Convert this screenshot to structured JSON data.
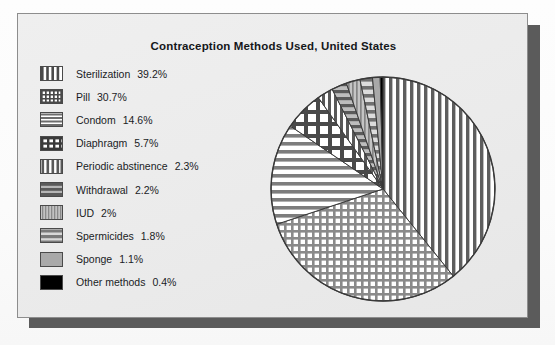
{
  "chart_data": {
    "type": "pie",
    "title": "Contraception Methods Used, United States",
    "xlabel": "",
    "ylabel": "",
    "legend_position": "left",
    "grid": false,
    "units": "percent",
    "start_angle_deg": 0,
    "direction": "clockwise",
    "categories": [
      "Sterilization",
      "Pill",
      "Condom",
      "Diaphragm",
      "Periodic abstinence",
      "Withdrawal",
      "IUD",
      "Spermicides",
      "Sponge",
      "Other methods"
    ],
    "values": [
      39.2,
      30.7,
      14.6,
      5.7,
      2.3,
      2.2,
      2.0,
      1.8,
      1.1,
      0.4
    ],
    "value_labels": [
      "39.2%",
      "30.7%",
      "14.6%",
      "5.7%",
      "2.3%",
      "2.2%",
      "2%",
      "1.8%",
      "1.1%",
      "0.4%"
    ],
    "slice_patterns": [
      "vertical-stripes",
      "grid-crosshatch",
      "horizontal-stripes",
      "coarse-checker",
      "vertical-stripes-wide",
      "horizontal-stripes-wide",
      "fine-vertical-stripes",
      "horizontal-bands",
      "solid-gray",
      "solid-black"
    ]
  },
  "legend": {
    "items": [
      {
        "label": "Sterilization",
        "value": "39.2%",
        "swatch": "vertical-stripes"
      },
      {
        "label": "Pill",
        "value": "30.7%",
        "swatch": "grid-crosshatch"
      },
      {
        "label": "Condom",
        "value": "14.6%",
        "swatch": "horizontal-stripes"
      },
      {
        "label": "Diaphragm",
        "value": "5.7%",
        "swatch": "coarse-checker"
      },
      {
        "label": "Periodic abstinence",
        "value": "2.3%",
        "swatch": "vertical-stripes-wide"
      },
      {
        "label": "Withdrawal",
        "value": "2.2%",
        "swatch": "horizontal-stripes-wide"
      },
      {
        "label": "IUD",
        "value": "2%",
        "swatch": "fine-vertical-stripes"
      },
      {
        "label": "Spermicides",
        "value": "1.8%",
        "swatch": "horizontal-bands"
      },
      {
        "label": "Sponge",
        "value": "1.1%",
        "swatch": "solid-gray"
      },
      {
        "label": "Other methods",
        "value": "0.4%",
        "swatch": "solid-black"
      }
    ]
  },
  "colors": {
    "panel_background": "#ebebeb",
    "page_background": "#fdfdfd",
    "panel_border": "#8d8d8d",
    "drop_shadow": "#5b5b5b",
    "title_text": "#15171a",
    "legend_text": "#1a1c1f",
    "pattern_ink": "#4a4a4a",
    "pattern_ink_dark": "#3a3a3a",
    "solid_gray": "#a9a9a9",
    "solid_black": "#000000",
    "slice_outline": "#3a3a3a"
  }
}
